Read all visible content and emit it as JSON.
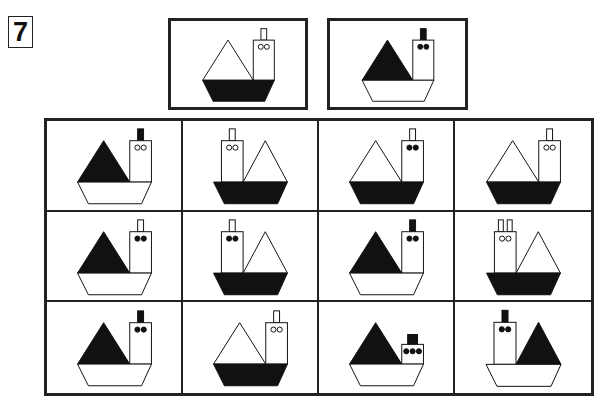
{
  "puzzle": {
    "number": "7"
  },
  "colors": {
    "ink": "#111111",
    "paper": "#ffffff",
    "border": "#222222"
  },
  "references": [
    {
      "id": "A",
      "cabin_side": "right",
      "sail": "white",
      "hull": "black",
      "chimney": "white",
      "chimney_count": 1,
      "portholes": "hollow",
      "porthole_count": 2,
      "cabin": "tall"
    },
    {
      "id": "B",
      "cabin_side": "right",
      "sail": "black",
      "hull": "white",
      "chimney": "black",
      "chimney_count": 1,
      "portholes": "filled",
      "porthole_count": 2,
      "cabin": "tall"
    }
  ],
  "grid": {
    "rows": 3,
    "cols": 4,
    "cells": [
      {
        "row": 1,
        "col": 1,
        "cabin_side": "right",
        "sail": "black",
        "hull": "white",
        "chimney": "black",
        "chimney_count": 1,
        "portholes": "hollow",
        "porthole_count": 2,
        "cabin": "tall"
      },
      {
        "row": 1,
        "col": 2,
        "cabin_side": "left",
        "sail": "white",
        "hull": "black",
        "chimney": "white",
        "chimney_count": 1,
        "portholes": "hollow",
        "porthole_count": 2,
        "cabin": "tall"
      },
      {
        "row": 1,
        "col": 3,
        "cabin_side": "right",
        "sail": "white",
        "hull": "black",
        "chimney": "white",
        "chimney_count": 1,
        "portholes": "filled",
        "porthole_count": 2,
        "cabin": "tall"
      },
      {
        "row": 1,
        "col": 4,
        "cabin_side": "right",
        "sail": "white",
        "hull": "black",
        "chimney": "white",
        "chimney_count": 1,
        "portholes": "hollow",
        "porthole_count": 2,
        "cabin": "tall"
      },
      {
        "row": 2,
        "col": 1,
        "cabin_side": "right",
        "sail": "black",
        "hull": "white",
        "chimney": "white",
        "chimney_count": 1,
        "portholes": "filled",
        "porthole_count": 2,
        "cabin": "tall"
      },
      {
        "row": 2,
        "col": 2,
        "cabin_side": "left",
        "sail": "white",
        "hull": "black",
        "chimney": "white",
        "chimney_count": 1,
        "portholes": "filled",
        "porthole_count": 2,
        "cabin": "tall"
      },
      {
        "row": 2,
        "col": 3,
        "cabin_side": "right",
        "sail": "black",
        "hull": "white",
        "chimney": "black",
        "chimney_count": 1,
        "portholes": "filled",
        "porthole_count": 2,
        "cabin": "tall"
      },
      {
        "row": 2,
        "col": 4,
        "cabin_side": "left",
        "sail": "white",
        "hull": "black",
        "chimney": "white",
        "chimney_count": 2,
        "portholes": "hollow",
        "porthole_count": 2,
        "cabin": "tall"
      },
      {
        "row": 3,
        "col": 1,
        "cabin_side": "right",
        "sail": "black",
        "hull": "white",
        "chimney": "black",
        "chimney_count": 1,
        "portholes": "filled",
        "porthole_count": 2,
        "cabin": "tall"
      },
      {
        "row": 3,
        "col": 2,
        "cabin_side": "right",
        "sail": "white",
        "hull": "black",
        "chimney": "white",
        "chimney_count": 1,
        "portholes": "hollow",
        "porthole_count": 2,
        "cabin": "tall"
      },
      {
        "row": 3,
        "col": 3,
        "cabin_side": "right",
        "sail": "black",
        "hull": "white",
        "chimney": "black-square",
        "chimney_count": 1,
        "portholes": "filled",
        "porthole_count": 3,
        "cabin": "short"
      },
      {
        "row": 3,
        "col": 4,
        "cabin_side": "left",
        "sail": "black",
        "hull": "white",
        "chimney": "black",
        "chimney_count": 1,
        "portholes": "filled",
        "porthole_count": 2,
        "cabin": "tall"
      }
    ]
  }
}
